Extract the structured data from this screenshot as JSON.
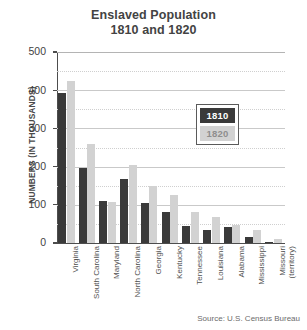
{
  "chart_data": {
    "type": "bar",
    "title": "Enslaved Population",
    "subtitle": "1810 and 1820",
    "xlabel": "",
    "ylabel": "NUMBERS (IN THOUSANDS)",
    "ylim": [
      0,
      500
    ],
    "yticks": [
      0,
      100,
      200,
      300,
      400,
      500
    ],
    "grid": true,
    "legend_position": "inside-right",
    "categories": [
      "Virginia",
      "South Carolina",
      "Maryland",
      "North Carolina",
      "Georgia",
      "Kentucky",
      "Tennessee",
      "Louisiana",
      "Alabama",
      "Mississippi",
      "Missouri (territory)"
    ],
    "series": [
      {
        "name": "1810",
        "color": "#3a3a3a",
        "values": [
          393,
          196,
          111,
          168,
          105,
          80,
          44,
          35,
          41,
          17,
          3
        ]
      },
      {
        "name": "1820",
        "color": "#d2d2d2",
        "values": [
          425,
          258,
          107,
          205,
          149,
          126,
          80,
          69,
          47,
          33,
          10
        ]
      }
    ],
    "source": "Source: U.S. Census Bureau"
  },
  "legend": {
    "items": [
      {
        "label": "1810"
      },
      {
        "label": "1820"
      }
    ]
  }
}
